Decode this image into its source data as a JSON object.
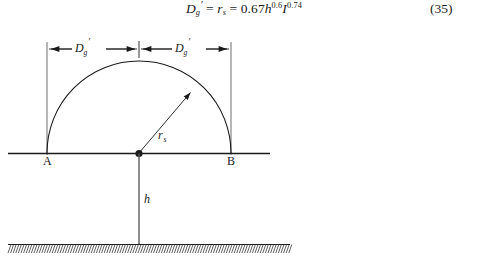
{
  "equation": {
    "lhs_symbol": "D",
    "lhs_sub": "g",
    "lhs_prime": "′",
    "eq1": "=",
    "mid_symbol": "r",
    "mid_sub": "s",
    "eq2": "=",
    "coefficient": "0.67",
    "var1": "h",
    "exp1": "0.6",
    "var2": "I",
    "exp2": "0.74",
    "number": "(35)",
    "plain_text": "D′g = rs = 0.67h^0.6 I^0.74"
  },
  "figure": {
    "labels": {
      "dim_left": {
        "symbol": "D",
        "sub": "g",
        "prime": "′"
      },
      "dim_right": {
        "symbol": "D",
        "sub": "g",
        "prime": "′"
      },
      "radius": {
        "symbol": "r",
        "sub": "s"
      },
      "point_a": "A",
      "point_b": "B",
      "height": "h"
    },
    "geometry": {
      "point_a_x": 47,
      "point_b_x": 231,
      "center_x": 139,
      "baseline_y": 127,
      "dome_radius": 92,
      "dimension_line_y": 23,
      "ground_y": 218,
      "hatch_left": 8,
      "hatch_right": 290,
      "radius_arrow_angle_deg": 55
    },
    "colors": {
      "ink": "#1a1a1a",
      "thin_line": "#2b2b2b",
      "background": "#ffffff"
    }
  }
}
